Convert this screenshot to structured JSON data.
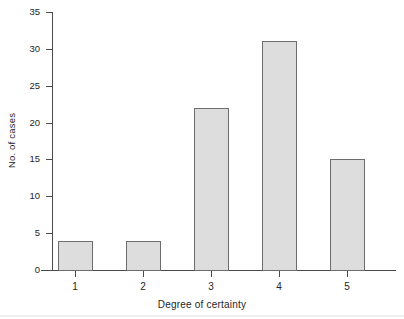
{
  "chart_data": {
    "type": "bar",
    "title": "",
    "subtitle": "",
    "xlabel": "Degree of certainty",
    "ylabel": "No. of cases",
    "categories": [
      "1",
      "2",
      "3",
      "4",
      "5"
    ],
    "values": [
      4,
      4,
      22,
      31,
      15
    ],
    "series": [
      {
        "name": "No. of cases",
        "values": [
          4,
          4,
          22,
          31,
          15
        ]
      }
    ],
    "ylim": [
      0,
      35
    ],
    "ytick_labels": [
      "0",
      "5",
      "10",
      "15",
      "20",
      "25",
      "30",
      "35"
    ],
    "ytick_values": [
      0,
      5,
      10,
      15,
      20,
      25,
      30,
      35
    ],
    "xtick_labels": [
      "1",
      "2",
      "3",
      "4",
      "5"
    ],
    "grid": false,
    "legend": false,
    "legend_position": "none",
    "annotations": [],
    "colors": {
      "bar_fill": "#dddddd",
      "bar_edge": "#6d6d6d",
      "axis": "#4a4a4a",
      "text": "#262626",
      "background": "#ffffff"
    }
  }
}
